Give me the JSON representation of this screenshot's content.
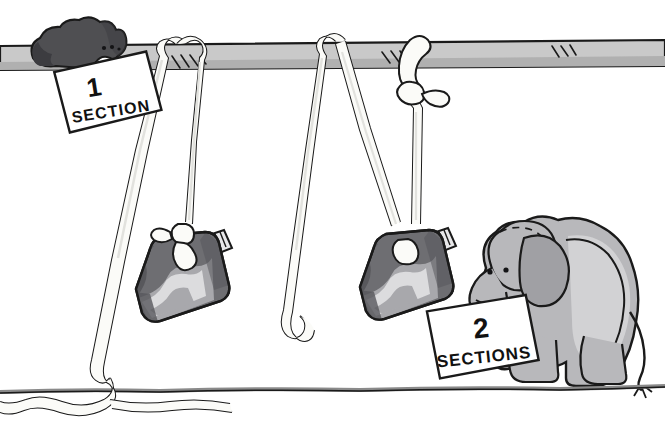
{
  "scene": {
    "title": "Cartoon illustration of elephants, hanging camouflage bags and section labels",
    "width": 665,
    "height": 443,
    "background_color": "#ffffff"
  },
  "colors": {
    "ink": "#1a1a1a",
    "paper": "#ffffff",
    "bar_fill": "#c9c9c9",
    "bar_shade": "#b0b0b0",
    "rope_fill": "#fbfbf8",
    "rope_shade": "#e2e2de",
    "dark_elephant": "#4f4f52",
    "dark_elephant_shade": "#3c3c40",
    "light_elephant": "#b8b8bb",
    "light_elephant_shade": "#a0a0a4",
    "light_elephant_hilite": "#d2d2d4",
    "bag_dark": "#6e6e72",
    "bag_mid": "#a8a8ac",
    "bag_light": "#dcdcde",
    "bag_rim": "#58585c",
    "nozzle": "#e8e8ea",
    "ground_line": "#8a8a8a",
    "card_fill": "#ffffff"
  },
  "labels": [
    {
      "id": "label-one-section",
      "number": "1",
      "caption": "SECTION",
      "x": 58,
      "y": 62,
      "rotation": -9
    },
    {
      "id": "label-two-sections",
      "number": "2",
      "caption": "SECTIONS",
      "x": 432,
      "y": 306,
      "rotation": -6
    }
  ],
  "figures": {
    "dark_elephant": {
      "name": "dark-elephant-on-bar",
      "description": "Dark gray elephant resting on top of the horizontal bar at upper left"
    },
    "light_elephant": {
      "name": "light-elephant-holding-sign",
      "description": "Light gray elephant seated at right holding the 2 SECTIONS card with its trunk"
    }
  },
  "objects": {
    "bar": {
      "name": "horizontal-bar",
      "description": "Gray horizontal beam spanning the full width near the top"
    },
    "bags": [
      {
        "name": "camouflage-bag-left",
        "description": "Camouflage patterned bag hanging from rope, left of center"
      },
      {
        "name": "camouflage-bag-right",
        "description": "Camouflage patterned bag hanging from rope, right of center"
      }
    ],
    "ropes": [
      {
        "name": "rope-left-diagonal",
        "description": "Rope running from bar down-left to coil on ground"
      },
      {
        "name": "rope-left-bag",
        "description": "Rope holding left camouflage bag"
      },
      {
        "name": "rope-middle-free",
        "description": "Free hanging rope end in the middle"
      },
      {
        "name": "rope-right-knotted",
        "description": "Rope knotted around the bar holding the right bag"
      }
    ],
    "ground": {
      "name": "ground-line",
      "description": "Horizontal ground line near the bottom"
    },
    "rope_coil": {
      "name": "rope-coil-on-ground",
      "description": "Loose rope end coiled on the ground at lower left"
    }
  }
}
